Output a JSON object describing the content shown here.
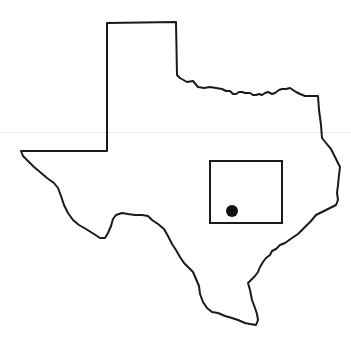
{
  "map": {
    "region": "Texas",
    "outline_color": "#1a1a1a",
    "background": "#ffffff",
    "inset_box": {
      "x": 210,
      "y": 161,
      "width": 72,
      "height": 62
    },
    "marker": {
      "cx": 232,
      "cy": 211,
      "r": 6,
      "color": "#111111"
    }
  }
}
